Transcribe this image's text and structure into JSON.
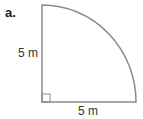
{
  "part_label": "a.",
  "shape": "quarter-circle",
  "radius_label_vertical": "5 m",
  "radius_label_horizontal": "5 m",
  "colors": {
    "stroke": "#8a8a8a",
    "text": "#333333"
  }
}
